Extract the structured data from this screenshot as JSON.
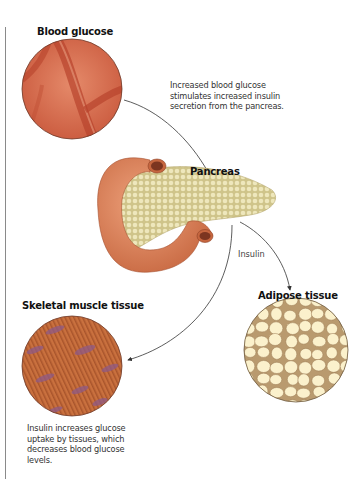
{
  "labels": {
    "blood_glucose": "Blood glucose",
    "pancreas": "Pancreas",
    "insulin": "Insulin",
    "adipose_tissue": "Adipose tissue",
    "skeletal_muscle_tissue": "Skeletal muscle tissue"
  },
  "captions": {
    "top": [
      "Increased blood glucose",
      "stimulates increased insulin",
      "secretion from the pancreas."
    ],
    "bottom": [
      "Insulin increases glucose",
      "uptake by tissues, which",
      "decreases blood glucose",
      "levels."
    ]
  },
  "colors": {
    "blood_base": "#d9694a",
    "blood_vessel": "#b8432c",
    "pancreas_tissue": "#e6dfae",
    "duodenum": "#d9835e",
    "adipose_cell": "#fbf1cc",
    "adipose_wall": "#b99a6e",
    "muscle_base": "#c56a3e",
    "muscle_nucleus": "#8e5a86",
    "arrow": "#333333"
  }
}
